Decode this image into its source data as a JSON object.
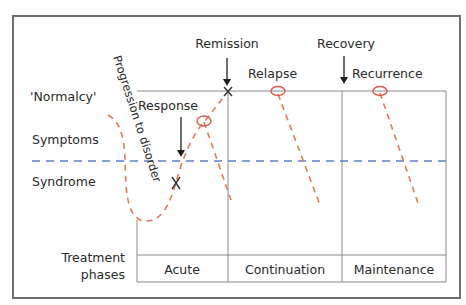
{
  "diagram": {
    "levels": {
      "normalcy": "'Normalcy'",
      "symptoms": "Symptoms",
      "syndrome": "Syndrome"
    },
    "events": {
      "remission": "Remission",
      "recovery": "Recovery",
      "response": "Response",
      "relapse": "Relapse",
      "recurrence": "Recurrence"
    },
    "curve_label": "Progression to disorder",
    "treatment": {
      "label_line1": "Treatment",
      "label_line2": "phases",
      "phases": [
        "Acute",
        "Continuation",
        "Maintenance"
      ]
    },
    "colors": {
      "course_curve": "#e07a5f",
      "event_circle": "#e05545",
      "syndrome_threshold": "#5b7fc9",
      "grid": "#8a8a8a",
      "text": "#2a2a2a"
    }
  }
}
